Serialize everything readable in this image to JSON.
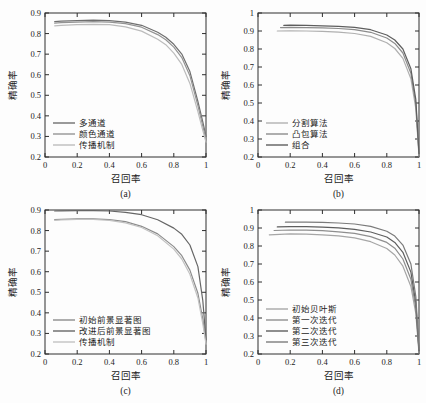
{
  "figure": {
    "background": "#fdfdfd",
    "axis_color": "#2e2e2e",
    "text_color": "#1c1c1c"
  },
  "chart_data": [
    {
      "id": "a",
      "type": "line",
      "caption": "(a)",
      "xlabel": "召回率",
      "ylabel": "精确率",
      "xlim": [
        0,
        1
      ],
      "ylim": [
        0.2,
        0.9
      ],
      "xticks": [
        0,
        0.2,
        0.4,
        0.6,
        0.8,
        1
      ],
      "yticks": [
        0.2,
        0.3,
        0.4,
        0.5,
        0.6,
        0.7,
        0.8,
        0.9
      ],
      "grid": false,
      "legend_position": "bottom-left",
      "series": [
        {
          "name": "多通道",
          "color": "#6f6f6f",
          "x": [
            0.06,
            0.1,
            0.2,
            0.3,
            0.4,
            0.5,
            0.6,
            0.7,
            0.75,
            0.8,
            0.85,
            0.9,
            0.95,
            0.98,
            1.0
          ],
          "y": [
            0.858,
            0.86,
            0.863,
            0.865,
            0.863,
            0.856,
            0.84,
            0.806,
            0.782,
            0.748,
            0.7,
            0.615,
            0.47,
            0.37,
            0.3
          ]
        },
        {
          "name": "颜色通道",
          "color": "#949494",
          "x": [
            0.06,
            0.1,
            0.2,
            0.3,
            0.4,
            0.5,
            0.6,
            0.7,
            0.75,
            0.8,
            0.85,
            0.9,
            0.95,
            0.98,
            1.0
          ],
          "y": [
            0.851,
            0.853,
            0.856,
            0.858,
            0.856,
            0.848,
            0.831,
            0.795,
            0.77,
            0.734,
            0.683,
            0.595,
            0.45,
            0.35,
            0.285
          ]
        },
        {
          "name": "传播机制",
          "color": "#bcbcbc",
          "x": [
            0.06,
            0.1,
            0.2,
            0.3,
            0.4,
            0.5,
            0.6,
            0.7,
            0.75,
            0.8,
            0.85,
            0.9,
            0.95,
            0.98,
            1.0
          ],
          "y": [
            0.838,
            0.84,
            0.843,
            0.845,
            0.843,
            0.833,
            0.812,
            0.772,
            0.746,
            0.705,
            0.65,
            0.558,
            0.42,
            0.33,
            0.272
          ]
        }
      ]
    },
    {
      "id": "b",
      "type": "line",
      "caption": "(b)",
      "xlabel": "召回率",
      "ylabel": "精确率",
      "xlim": [
        0,
        1
      ],
      "ylim": [
        0.2,
        1.0
      ],
      "xticks": [
        0,
        0.2,
        0.4,
        0.6,
        0.8,
        1
      ],
      "yticks": [
        0.2,
        0.3,
        0.4,
        0.5,
        0.6,
        0.7,
        0.8,
        0.9,
        1
      ],
      "grid": false,
      "legend_position": "bottom-left",
      "series": [
        {
          "name": "分割算法",
          "color": "#b0b0b0",
          "x": [
            0.12,
            0.2,
            0.3,
            0.4,
            0.5,
            0.6,
            0.7,
            0.8,
            0.85,
            0.9,
            0.95,
            0.98,
            1.0
          ],
          "y": [
            0.9,
            0.901,
            0.9,
            0.898,
            0.894,
            0.886,
            0.87,
            0.835,
            0.803,
            0.748,
            0.635,
            0.47,
            0.205
          ]
        },
        {
          "name": "凸包算法",
          "color": "#8c8c8c",
          "x": [
            0.14,
            0.2,
            0.3,
            0.4,
            0.5,
            0.6,
            0.7,
            0.8,
            0.85,
            0.9,
            0.95,
            0.98,
            1.0
          ],
          "y": [
            0.919,
            0.92,
            0.919,
            0.917,
            0.914,
            0.907,
            0.893,
            0.861,
            0.831,
            0.778,
            0.665,
            0.495,
            0.212
          ]
        },
        {
          "name": "组合",
          "color": "#5e5e5e",
          "x": [
            0.16,
            0.2,
            0.3,
            0.4,
            0.5,
            0.6,
            0.7,
            0.8,
            0.85,
            0.9,
            0.95,
            0.98,
            1.0
          ],
          "y": [
            0.931,
            0.932,
            0.931,
            0.929,
            0.926,
            0.92,
            0.907,
            0.878,
            0.85,
            0.8,
            0.69,
            0.52,
            0.22
          ]
        }
      ]
    },
    {
      "id": "c",
      "type": "line",
      "caption": "(c)",
      "xlabel": "召回率",
      "ylabel": "精确率",
      "xlim": [
        0,
        1
      ],
      "ylim": [
        0.2,
        0.9
      ],
      "xticks": [
        0,
        0.2,
        0.4,
        0.6,
        0.8,
        1
      ],
      "yticks": [
        0.2,
        0.3,
        0.4,
        0.5,
        0.6,
        0.7,
        0.8,
        0.9
      ],
      "grid": false,
      "legend_position": "bottom-left",
      "series": [
        {
          "name": "初始前景显著图",
          "color": "#8c8c8c",
          "x": [
            0.06,
            0.1,
            0.2,
            0.3,
            0.4,
            0.5,
            0.6,
            0.7,
            0.8,
            0.85,
            0.9,
            0.95,
            0.98,
            1.0
          ],
          "y": [
            0.853,
            0.855,
            0.857,
            0.857,
            0.853,
            0.843,
            0.821,
            0.784,
            0.722,
            0.678,
            0.608,
            0.495,
            0.37,
            0.258
          ]
        },
        {
          "name": "改进后前景显著图",
          "color": "#666666",
          "x": [
            0.06,
            0.1,
            0.2,
            0.3,
            0.4,
            0.5,
            0.6,
            0.7,
            0.8,
            0.85,
            0.9,
            0.95,
            0.98,
            1.0
          ],
          "y": [
            0.895,
            0.896,
            0.897,
            0.897,
            0.895,
            0.889,
            0.877,
            0.853,
            0.812,
            0.782,
            0.73,
            0.625,
            0.46,
            0.27
          ]
        },
        {
          "name": "传播机制",
          "color": "#c2c2c2",
          "x": [
            0.06,
            0.1,
            0.2,
            0.3,
            0.4,
            0.5,
            0.6,
            0.7,
            0.8,
            0.85,
            0.9,
            0.95,
            0.98,
            1.0
          ],
          "y": [
            0.85,
            0.852,
            0.854,
            0.854,
            0.85,
            0.838,
            0.815,
            0.775,
            0.71,
            0.662,
            0.588,
            0.472,
            0.348,
            0.248
          ]
        }
      ]
    },
    {
      "id": "d",
      "type": "line",
      "caption": "(d)",
      "xlabel": "召回率",
      "ylabel": "精确率",
      "xlim": [
        0,
        1
      ],
      "ylim": [
        0.2,
        1.0
      ],
      "xticks": [
        0,
        0.2,
        0.4,
        0.6,
        0.8,
        1
      ],
      "yticks": [
        0.2,
        0.3,
        0.4,
        0.5,
        0.6,
        0.7,
        0.8,
        0.9,
        1
      ],
      "grid": false,
      "legend_position": "bottom-left",
      "series": [
        {
          "name": "初始贝叶斯",
          "color": "#a6a6a6",
          "x": [
            0.07,
            0.2,
            0.3,
            0.4,
            0.5,
            0.6,
            0.7,
            0.8,
            0.85,
            0.9,
            0.95,
            0.98,
            1.0
          ],
          "y": [
            0.862,
            0.867,
            0.866,
            0.862,
            0.856,
            0.845,
            0.824,
            0.786,
            0.75,
            0.688,
            0.575,
            0.425,
            0.205
          ]
        },
        {
          "name": "第一次迭代",
          "color": "#8e8e8e",
          "x": [
            0.1,
            0.2,
            0.3,
            0.4,
            0.5,
            0.6,
            0.7,
            0.8,
            0.85,
            0.9,
            0.95,
            0.98,
            1.0
          ],
          "y": [
            0.886,
            0.889,
            0.888,
            0.885,
            0.879,
            0.87,
            0.852,
            0.82,
            0.788,
            0.728,
            0.615,
            0.455,
            0.212
          ]
        },
        {
          "name": "第二次迭代",
          "color": "#5e5e5e",
          "x": [
            0.12,
            0.2,
            0.3,
            0.4,
            0.5,
            0.6,
            0.7,
            0.8,
            0.85,
            0.9,
            0.95,
            0.98,
            1.0
          ],
          "y": [
            0.906,
            0.908,
            0.908,
            0.905,
            0.901,
            0.893,
            0.878,
            0.85,
            0.82,
            0.765,
            0.655,
            0.485,
            0.218
          ]
        },
        {
          "name": "第三次迭代",
          "color": "#7b7b7b",
          "x": [
            0.17,
            0.2,
            0.3,
            0.4,
            0.5,
            0.6,
            0.7,
            0.8,
            0.85,
            0.9,
            0.95,
            0.98,
            1.0
          ],
          "y": [
            0.932,
            0.933,
            0.933,
            0.931,
            0.928,
            0.922,
            0.909,
            0.882,
            0.855,
            0.805,
            0.7,
            0.52,
            0.225
          ]
        }
      ]
    }
  ]
}
